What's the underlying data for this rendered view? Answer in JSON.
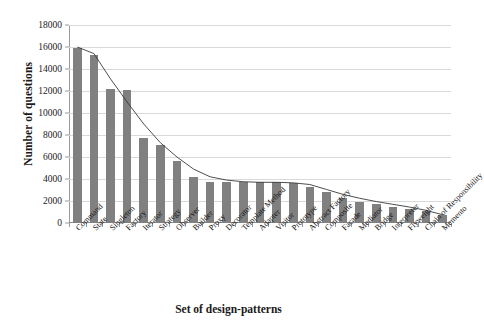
{
  "chart_data": {
    "type": "bar",
    "title": "",
    "xlabel": "Set of design-patterns",
    "ylabel": "Number of questions",
    "ylim": [
      0,
      18000
    ],
    "ytick_step": 2000,
    "yticks": [
      0,
      2000,
      4000,
      6000,
      8000,
      10000,
      12000,
      14000,
      16000,
      18000
    ],
    "grid": true,
    "legend": "none",
    "bar_color": "#808080",
    "trendline_color": "#3a3a3a",
    "categories": [
      "Command",
      "State",
      "Singleton",
      "Factory",
      "Iterator",
      "Strategy",
      "Observer",
      "Builder",
      "Proxy",
      "Decorator",
      "Template Method",
      "Adapter",
      "Visitor",
      "Prototype",
      "Abstract Factory",
      "Composite",
      "Facade",
      "Mediator",
      "Bridge",
      "Interpreter",
      "Flyweight",
      "Chain of Responsibility",
      "Memento"
    ],
    "values": [
      15900,
      15300,
      12200,
      12100,
      7700,
      7100,
      5600,
      4200,
      3700,
      3700,
      3700,
      3700,
      3700,
      3600,
      3300,
      2800,
      2300,
      1900,
      1700,
      1500,
      1300,
      1100,
      700
    ],
    "series": [
      {
        "name": "Number of questions",
        "values": [
          15900,
          15300,
          12200,
          12100,
          7700,
          7100,
          5600,
          4200,
          3700,
          3700,
          3700,
          3700,
          3700,
          3600,
          3300,
          2800,
          2300,
          1900,
          1700,
          1500,
          1300,
          1100,
          700
        ]
      },
      {
        "name": "trendline",
        "type": "line",
        "values": [
          16000,
          15400,
          13100,
          11000,
          9000,
          7300,
          6000,
          4900,
          4200,
          3900,
          3750,
          3700,
          3700,
          3650,
          3500,
          3050,
          2600,
          2250,
          1950,
          1700,
          1450,
          1150,
          750
        ]
      }
    ]
  }
}
